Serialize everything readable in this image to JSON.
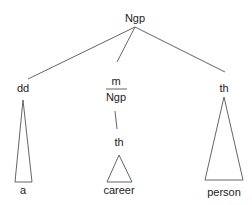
{
  "diagram": {
    "type": "syntax-tree",
    "root": {
      "label": "Ngp"
    },
    "children": [
      {
        "label": "dd",
        "leaf": "a",
        "roof": true
      },
      {
        "label_top": "m",
        "label_bottom": "Ngp",
        "child": {
          "label": "th",
          "leaf": "career",
          "roof": true
        }
      },
      {
        "label": "th",
        "leaf": "person",
        "roof": true
      }
    ]
  },
  "labels": {
    "root": "Ngp",
    "dd": "dd",
    "a": "a",
    "m": "m",
    "ngp_mid": "Ngp",
    "th_mid": "th",
    "career": "career",
    "th_right": "th",
    "person": "person"
  },
  "colors": {
    "line": "#555555",
    "text": "#222222",
    "background": "#ffffff"
  }
}
